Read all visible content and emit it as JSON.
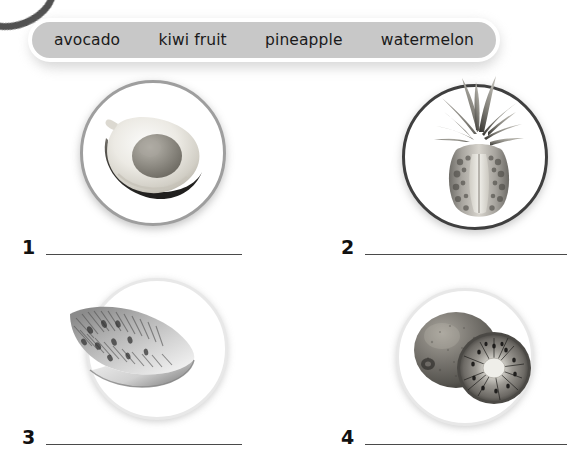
{
  "page": {
    "background_color": "#ffffff",
    "decoration": {
      "corner_arc_color": "#3a3a3a"
    }
  },
  "word_bank": {
    "background_color": "#c8c8c8",
    "border_color": "#ffffff",
    "words": [
      {
        "label": "avocado"
      },
      {
        "label": "kiwi fruit"
      },
      {
        "label": "pineapple"
      },
      {
        "label": "watermelon"
      }
    ]
  },
  "exercise": {
    "items": [
      {
        "number": "1",
        "picture": "avocado-photo",
        "ring_color": "#9e9e9e",
        "answer_value": "",
        "answer_placeholder": ""
      },
      {
        "number": "2",
        "picture": "pineapple-photo",
        "ring_color": "#3f3f3f",
        "answer_value": "",
        "answer_placeholder": ""
      },
      {
        "number": "3",
        "picture": "watermelon-photo",
        "ring_color": "#e8e8e8",
        "answer_value": "",
        "answer_placeholder": ""
      },
      {
        "number": "4",
        "picture": "kiwi-fruit-photo",
        "ring_color": "#e8e8e8",
        "answer_value": "",
        "answer_placeholder": ""
      }
    ]
  }
}
